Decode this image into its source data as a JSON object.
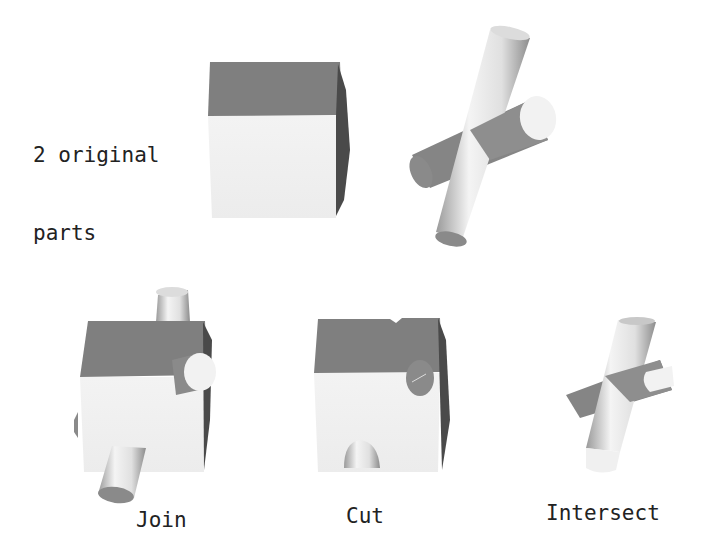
{
  "title_label": {
    "line1": "2 original",
    "line2": "parts"
  },
  "operations": [
    {
      "id": "join",
      "label": "Join"
    },
    {
      "id": "cut",
      "label": "Cut"
    },
    {
      "id": "intersect",
      "label": "Intersect"
    }
  ],
  "parts": [
    {
      "id": "cube",
      "name": "Cube"
    },
    {
      "id": "crossed-cylinders",
      "name": "Crossed cylinders"
    }
  ],
  "colors": {
    "background": "#ffffff",
    "top_face": "#7f7f7f",
    "front_face": "#f0f0f0",
    "side_face": "#4a4a4a",
    "cyl_light": "#f2f2f2",
    "cyl_mid": "#bdbdbd",
    "cyl_dark": "#7a7a7a",
    "text": "#222222"
  }
}
